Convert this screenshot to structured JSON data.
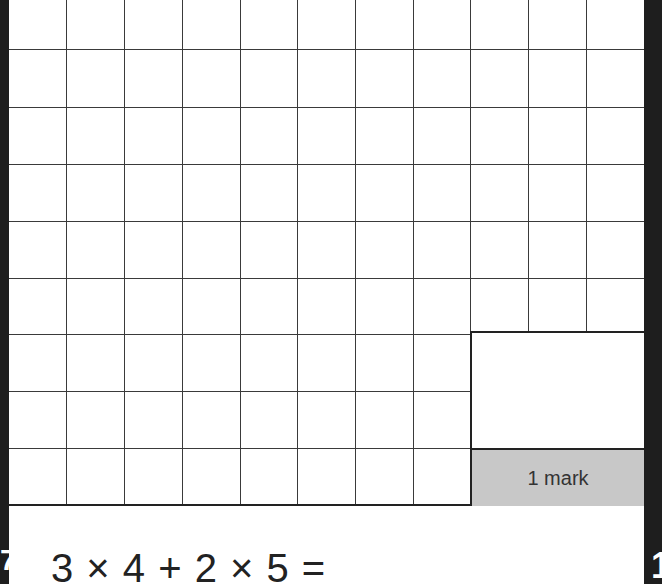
{
  "worksheet": {
    "grid": {
      "columns": 11,
      "rows": 9,
      "vertical_lines_x": [
        66,
        124,
        182,
        240,
        297,
        355,
        413,
        470,
        528,
        586
      ],
      "horizontal_lines_y": [
        49,
        107,
        164,
        221,
        278,
        334,
        391,
        448
      ]
    },
    "mark_box": {
      "label": "1 mark"
    },
    "question": {
      "expression": "3 × 4 + 2 × 5 =",
      "answer_value": ""
    },
    "margin_left_glyph": "7",
    "margin_right_glyph": "1"
  }
}
